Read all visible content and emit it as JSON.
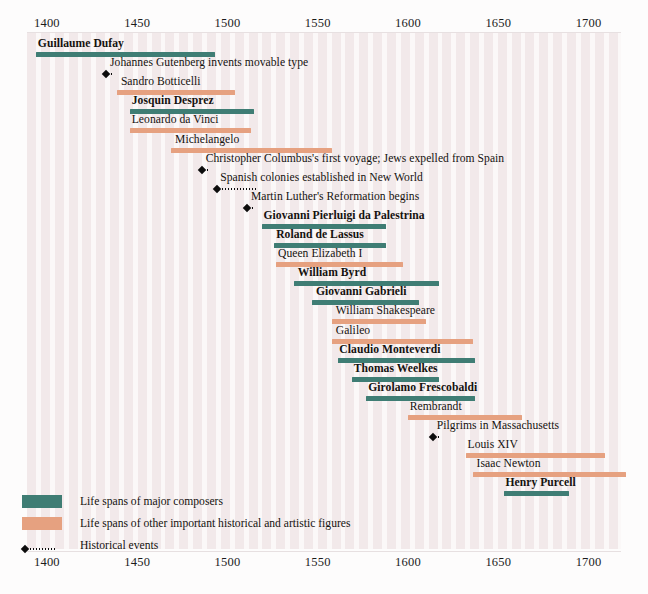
{
  "top_caption": "",
  "axis": {
    "ticks": [
      1400,
      1450,
      1500,
      1550,
      1600,
      1650,
      1700
    ],
    "tick_labels": [
      "1400",
      "1450",
      "1500",
      "1550",
      "1600",
      "1650",
      "1700"
    ],
    "min": 1395,
    "max": 1724
  },
  "legend": {
    "composer_label": "Life spans of major composers",
    "figure_label": "Life spans of other important historical and artistic figures",
    "event_label": "Historical events",
    "composer_color": "#3f7d74",
    "figure_color": "#e6a180",
    "event_color": "#0d0d0d"
  },
  "chart_data": {
    "type": "bar",
    "title": "",
    "xlabel": "",
    "ylabel": "",
    "xlim": [
      1395,
      1724
    ],
    "grid": "decade-stripes",
    "legend_position": "bottom-left",
    "rows": [
      {
        "label": "Guillaume Dufay",
        "kind": "composer",
        "start": 1400,
        "end": 1499,
        "label_x": 1401
      },
      {
        "label": "Johannes Gutenberg invents movable type",
        "kind": "event",
        "year": 1439,
        "tail_end": 1441,
        "label_x": 1441
      },
      {
        "label": "Sandro Botticelli",
        "kind": "figure",
        "start": 1445,
        "end": 1510,
        "label_x": 1447
      },
      {
        "label": "Josquin Desprez",
        "kind": "composer",
        "start": 1452,
        "end": 1521,
        "label_x": 1453
      },
      {
        "label": "Leonardo da Vinci",
        "kind": "figure",
        "start": 1452,
        "end": 1519,
        "label_x": 1453
      },
      {
        "label": "Michelangelo",
        "kind": "figure",
        "start": 1475,
        "end": 1564,
        "label_x": 1477
      },
      {
        "label": "Christopher Columbus's first voyage; Jews expelled from Spain",
        "kind": "event",
        "year": 1492,
        "tail_end": 1494,
        "label_x": 1494
      },
      {
        "label": "Spanish colonies established in New World",
        "kind": "event",
        "year": 1500,
        "tail_end": 1521,
        "label_x": 1502
      },
      {
        "label": "Martin Luther's Reformation begins",
        "kind": "event",
        "year": 1517,
        "tail_end": 1519,
        "label_x": 1519
      },
      {
        "label": "Giovanni Pierluigi da Palestrina",
        "kind": "composer",
        "start": 1525,
        "end": 1594,
        "label_x": 1526
      },
      {
        "label": "Roland de Lassus",
        "kind": "composer",
        "start": 1532,
        "end": 1594,
        "label_x": 1533
      },
      {
        "label": "Queen Elizabeth I",
        "kind": "figure",
        "start": 1533,
        "end": 1603,
        "label_x": 1534
      },
      {
        "label": "William Byrd",
        "kind": "composer",
        "start": 1543,
        "end": 1623,
        "label_x": 1545
      },
      {
        "label": "Giovanni Gabrieli",
        "kind": "composer",
        "start": 1553,
        "end": 1612,
        "label_x": 1555
      },
      {
        "label": "William Shakespeare",
        "kind": "figure",
        "start": 1564,
        "end": 1616,
        "label_x": 1566
      },
      {
        "label": "Galileo",
        "kind": "figure",
        "start": 1564,
        "end": 1642,
        "label_x": 1566
      },
      {
        "label": "Claudio Monteverdi",
        "kind": "composer",
        "start": 1567,
        "end": 1643,
        "label_x": 1568
      },
      {
        "label": "Thomas Weelkes",
        "kind": "composer",
        "start": 1575,
        "end": 1623,
        "label_x": 1576
      },
      {
        "label": "Girolamo Frescobaldi",
        "kind": "composer",
        "start": 1583,
        "end": 1643,
        "label_x": 1584
      },
      {
        "label": "Rembrandt",
        "kind": "figure",
        "start": 1606,
        "end": 1669,
        "label_x": 1607
      },
      {
        "label": "Pilgrims in Massachusetts",
        "kind": "event",
        "year": 1620,
        "tail_end": 1622,
        "label_x": 1622
      },
      {
        "label": "Louis XIV",
        "kind": "figure",
        "start": 1638,
        "end": 1715,
        "label_x": 1639
      },
      {
        "label": "Isaac Newton",
        "kind": "figure",
        "start": 1642,
        "end": 1727,
        "label_x": 1644
      },
      {
        "label": "Henry Purcell",
        "kind": "composer",
        "start": 1659,
        "end": 1695,
        "label_x": 1660
      }
    ]
  }
}
